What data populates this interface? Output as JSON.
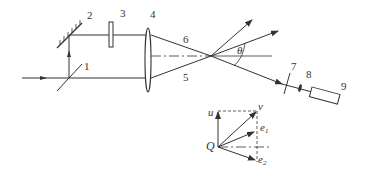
{
  "labels": {
    "beamsplitter": "1",
    "mirror": "2",
    "element3": "3",
    "lens": "4",
    "beam_lower": "5",
    "beam_upper": "6",
    "element7": "7",
    "element8": "8",
    "detector": "9",
    "angle": "θ"
  },
  "vector_labels": {
    "origin": "Q",
    "u": "u",
    "v": "v",
    "e1": "e",
    "e1_sub": "1",
    "e2": "e",
    "e2_sub": "2"
  },
  "colors": {
    "stroke": "#333333",
    "background": "#ffffff"
  }
}
